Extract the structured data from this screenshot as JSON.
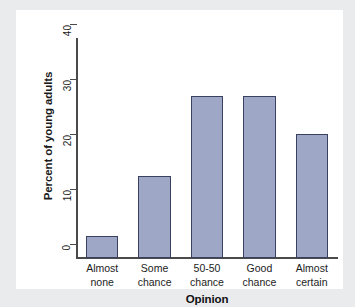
{
  "chart_data": {
    "type": "bar",
    "title": "",
    "subtitle": "",
    "xlabel": "Opinion",
    "ylabel": "Percent of young adults",
    "categories": [
      "Almost none",
      "Some chance",
      "50-50 chance",
      "Good chance",
      "Almost certain"
    ],
    "category_lines": [
      [
        "Almost",
        "none"
      ],
      [
        "Some",
        "chance"
      ],
      [
        "50-50",
        "chance"
      ],
      [
        "Good",
        "chance"
      ],
      [
        "Almost",
        "certain"
      ]
    ],
    "values": [
      4,
      15,
      29.5,
      29.5,
      22.5
    ],
    "ylim": [
      0,
      40
    ],
    "yticks": [
      0,
      10,
      20,
      30,
      40
    ],
    "ytick_labels": [
      "0",
      "10",
      "20",
      "30",
      "40"
    ],
    "grid": false,
    "legend": false,
    "bar_fill_color": "#9fa7c6",
    "bar_edge_color": "#3a4060",
    "axis_color": "#4a4a4a",
    "plot_background": "#ffffff",
    "page_background": "#eaebed"
  }
}
